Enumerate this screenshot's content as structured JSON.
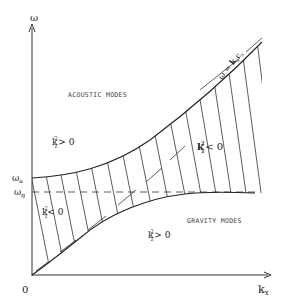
{
  "diagram": {
    "axes": {
      "y_label": "ω",
      "x_label_main": "k",
      "x_label_sub": "x",
      "origin_label": "0"
    },
    "levels": {
      "omega_a": {
        "main": "ω",
        "sub": "a"
      },
      "omega_g": {
        "main": "ω",
        "sub": "g"
      }
    },
    "regions": {
      "acoustic": "ACOUSTIC MODES",
      "gravity": "GRAVITY MODES"
    },
    "conditions": {
      "upper_left": {
        "k": "k",
        "sup": "2",
        "sub": "z",
        "rel": "> 0"
      },
      "upper_right": {
        "k": "k",
        "sup": "2",
        "sub": "z",
        "rel": "< 0"
      },
      "left_band": {
        "k": "k",
        "sup": "2",
        "sub": "z",
        "rel": "< 0"
      },
      "lower": {
        "k": "k",
        "sup": "2",
        "sub": "z",
        "rel": "> 0"
      }
    },
    "asymptote": {
      "lhs": "ω = ",
      "k": "k",
      "k_sub": "x",
      "c": "c",
      "c_sub": "s"
    },
    "colors": {
      "ink": "#222222",
      "background": "#ffffff"
    }
  }
}
